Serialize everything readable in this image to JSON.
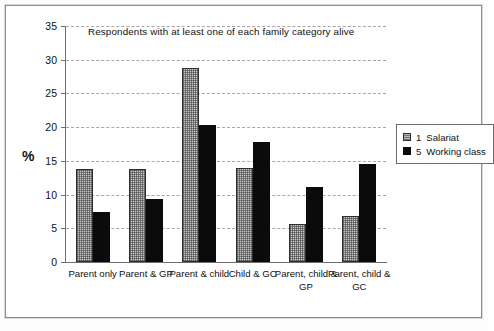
{
  "chart_data": {
    "type": "bar",
    "title": "Respondents with at least one of each family category alive",
    "xlabel": "",
    "ylabel": "%",
    "ylim": [
      0,
      35
    ],
    "ytick_step": 5,
    "yticks": [
      35,
      30,
      25,
      20,
      15,
      10,
      5,
      0
    ],
    "grid": true,
    "grid_style": "dashed-horizontal",
    "legend_position": "right",
    "categories": [
      "Parent only",
      "Parent & GP",
      "Parent & child",
      "Child & GC",
      "Parent, child & GP",
      "Parent, child & GC"
    ],
    "series": [
      {
        "name": "1  Salariat",
        "key": "1",
        "label": "Salariat",
        "color": "#b8b8b8",
        "values": [
          13.8,
          13.8,
          28.7,
          13.9,
          5.6,
          6.8
        ]
      },
      {
        "name": "5  Working class",
        "key": "5",
        "label": "Working class",
        "color": "#0b0b0b",
        "values": [
          7.4,
          9.3,
          20.3,
          17.8,
          11.1,
          14.6
        ]
      }
    ]
  },
  "legend": {
    "items": [
      {
        "key": "1",
        "label": "Salariat"
      },
      {
        "key": "5",
        "label": "Working class"
      }
    ]
  }
}
